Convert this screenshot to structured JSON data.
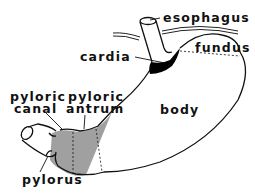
{
  "diagram": {
    "type": "anatomical-illustration",
    "labels": {
      "esophagus": "esophagus",
      "fundus": "fundus",
      "cardia": "cardia",
      "pyloric_canal_line1": "pyloric",
      "pyloric_canal_line2": "canal",
      "pyloric_antrum_line1": "pyloric",
      "pyloric_antrum_line2": "antrum",
      "body": "body",
      "pylorus": "pylorus"
    },
    "colors": {
      "outline": "#111111",
      "cardia_fill": "#000000",
      "pyloric_region_fill": "#a0a0a0",
      "background": "#ffffff"
    }
  }
}
